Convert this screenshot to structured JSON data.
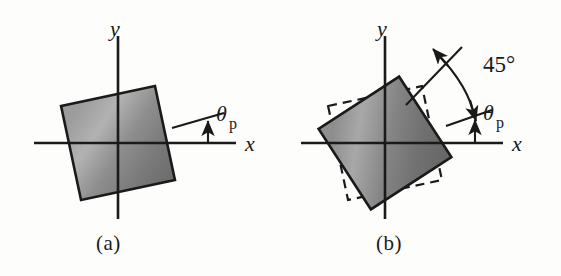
{
  "figure": {
    "background_color": "#fdfdfc",
    "ink_color": "#1a1a1a",
    "panels": [
      {
        "id": "a",
        "caption": "(a)",
        "axis_x_label": "x",
        "axis_y_label": "y",
        "angle_label": "θ",
        "angle_subscript": "p",
        "element_rotation_deg": 12,
        "shows_dashed_reference": false,
        "fill_color": "#8a8a8a",
        "edge_color": "#1a1a1a"
      },
      {
        "id": "b",
        "caption": "(b)",
        "axis_x_label": "x",
        "axis_y_label": "y",
        "angle_label": "θ",
        "angle_subscript": "p",
        "arc_label": "45°",
        "element_rotation_deg": 33,
        "reference_rotation_deg": 12,
        "shows_dashed_reference": true,
        "fill_color": "#7c7c7c",
        "edge_color": "#1a1a1a"
      }
    ]
  }
}
